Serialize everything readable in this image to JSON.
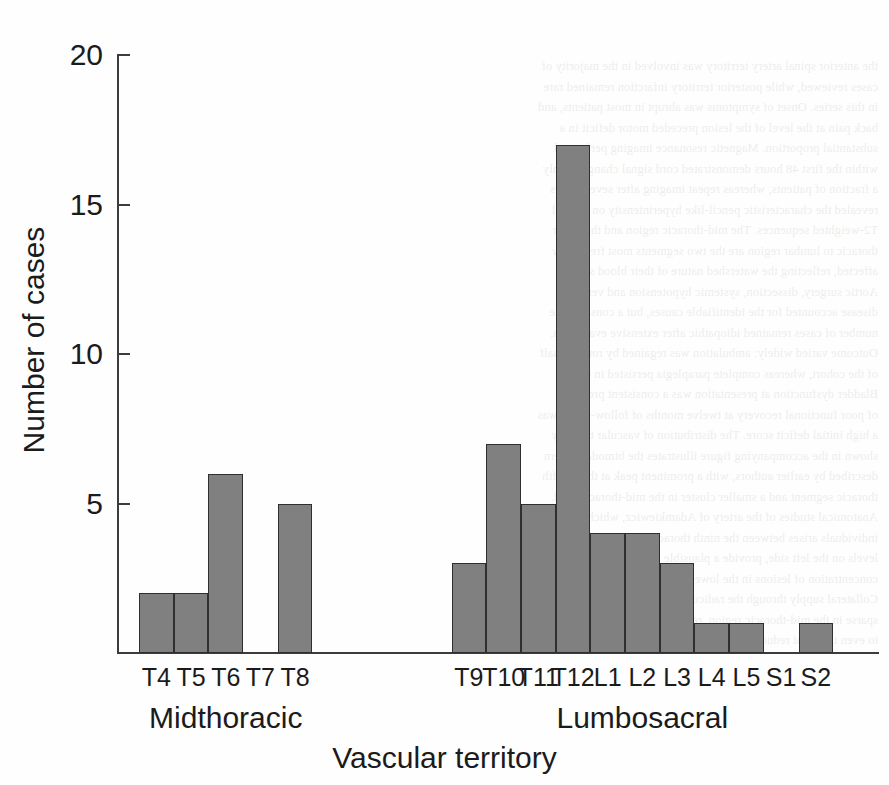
{
  "chart_data": {
    "type": "bar",
    "title": "",
    "xlabel": "Vascular territory",
    "ylabel": "Number of cases",
    "categories": [
      "T4",
      "T5",
      "T6",
      "T7",
      "T8",
      "T9",
      "T10",
      "T11",
      "T12",
      "L1",
      "L2",
      "L3",
      "L4",
      "L5",
      "S1",
      "S2"
    ],
    "values": [
      2,
      2,
      6,
      0,
      5,
      3,
      7,
      5,
      17,
      4,
      4,
      3,
      1,
      1,
      0,
      1
    ],
    "ylim": [
      0,
      20
    ],
    "yticks": [
      5,
      10,
      15,
      20
    ],
    "ytick_labels": [
      "5",
      "10",
      "15",
      "20"
    ],
    "grid": false,
    "legend": false,
    "bar_color": "#808080",
    "bar_edge_color": "#2f2f2f",
    "axis_color": "#3c3c3c",
    "groups": [
      {
        "label": "Midthoracic",
        "categories": [
          "T4",
          "T5",
          "T6",
          "T7",
          "T8"
        ]
      },
      {
        "label": "Lumbosacral",
        "categories": [
          "T9",
          "T10",
          "T11",
          "T12",
          "L1",
          "L2",
          "L3",
          "L4",
          "L5",
          "S1",
          "S2"
        ]
      }
    ]
  },
  "background_text": {
    "note": "faint mirrored show-through from reverse of scanned page",
    "lines": [
      "the anterior spinal artery territory was involved in the majority of",
      "cases reviewed, while posterior territory infarction remained rare",
      "in this series. Onset of symptoms was abrupt in most patients, and",
      "back pain at the level of the lesion preceded motor deficit in a",
      "substantial proportion. Magnetic resonance imaging performed",
      "within the first 48 hours demonstrated cord signal change in only",
      "a fraction of patients, whereas repeat imaging after several days",
      "revealed the characteristic pencil-like hyperintensity on sagittal",
      "T2-weighted sequences. The mid-thoracic region and the lower",
      "thoracic to lumbar region are the two segments most frequently",
      "affected, reflecting the watershed nature of their blood supply.",
      "Aortic surgery, dissection, systemic hypotension and vertebral",
      "disease accounted for the identifiable causes, but a considerable",
      "number of cases remained idiopathic after extensive evaluation.",
      "Outcome varied widely: ambulation was regained by roughly half",
      "of the cohort, whereas complete paraplegia persisted in others.",
      "Bladder dysfunction at presentation was a consistent predictor",
      "of poor functional recovery at twelve months of follow-up, as was",
      "a high initial deficit score. The distribution of vascular territory",
      "shown in the accompanying figure illustrates the bimodal pattern",
      "described by earlier authors, with a prominent peak at the twelfth",
      "thoracic segment and a smaller cluster in the mid-thoracic cord.",
      "Anatomical studies of the artery of Adamkiewicz, which in most",
      "individuals arises between the ninth thoracic and second lumbar",
      "levels on the left side, provide a plausible explanation for this",
      "concentration of lesions in the lower thoracic segments of cord.",
      "Collateral supply through the radicular arteries is comparatively",
      "sparse in the mid-thoracic region, rendering that zone vulnerable",
      "to even transient reductions in systemic perfusion pressure."
    ]
  }
}
